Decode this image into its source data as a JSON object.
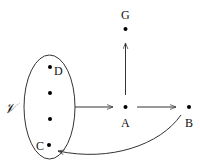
{
  "diagram": {
    "type": "directed-graph",
    "set": {
      "label": "𝒱",
      "shape": "ellipse",
      "members": [
        "D",
        "",
        "",
        "C"
      ]
    },
    "nodes": [
      {
        "id": "G",
        "label": "G"
      },
      {
        "id": "A",
        "label": "A"
      },
      {
        "id": "B",
        "label": "B"
      },
      {
        "id": "D",
        "label": "D"
      },
      {
        "id": "C",
        "label": "C"
      }
    ],
    "edges": [
      {
        "from": "𝒱",
        "to": "A"
      },
      {
        "from": "A",
        "to": "G"
      },
      {
        "from": "A",
        "to": "B"
      },
      {
        "from": "B",
        "to": "C",
        "style": "curved"
      }
    ],
    "colors": {
      "stroke": "#333333",
      "node": "#000000",
      "background": "#ffffff"
    }
  }
}
